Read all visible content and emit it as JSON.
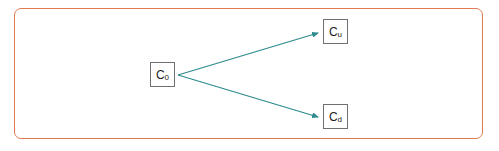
{
  "diagram": {
    "type": "binomial-tree",
    "colors": {
      "frame_border": "#e07a52",
      "arrow": "#2e8b8e",
      "node_border": "#707070",
      "text": "#222222"
    },
    "nodes": [
      {
        "id": "c0",
        "label": "C",
        "subscript": "0"
      },
      {
        "id": "cu",
        "label": "C",
        "subscript": "u"
      },
      {
        "id": "cd",
        "label": "C",
        "subscript": "d"
      }
    ],
    "edges": [
      {
        "from": "c0",
        "to": "cu"
      },
      {
        "from": "c0",
        "to": "cd"
      }
    ]
  }
}
